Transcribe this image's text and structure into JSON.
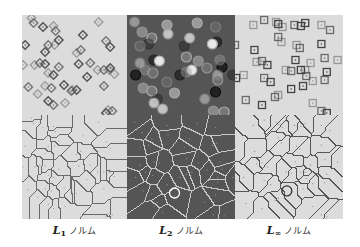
{
  "figure": {
    "panels": [
      {
        "id": "l1",
        "row": "top",
        "bg": "#dcdcdc",
        "marker": "diamond",
        "stroke": "#555555",
        "x": 22,
        "y": 15,
        "w": 105,
        "h": 100,
        "points": [
          [
            9,
            3
          ],
          [
            11,
            8
          ],
          [
            20,
            12
          ],
          [
            30,
            11
          ],
          [
            32,
            16
          ],
          [
            35,
            25
          ],
          [
            31,
            30
          ],
          [
            25,
            30
          ],
          [
            22,
            37
          ],
          [
            12,
            50
          ],
          [
            17,
            48
          ],
          [
            22,
            49
          ],
          [
            25,
            58
          ],
          [
            35,
            52
          ],
          [
            30,
            60
          ],
          [
            22,
            71
          ],
          [
            28,
            73
          ],
          [
            40,
            70
          ],
          [
            48,
            75
          ],
          [
            47,
            76
          ],
          [
            62,
            62
          ],
          [
            72,
            55
          ],
          [
            78,
            55
          ],
          [
            84,
            53
          ],
          [
            88,
            59
          ],
          [
            65,
            48
          ],
          [
            54,
            49
          ],
          [
            52,
            38
          ],
          [
            56,
            35
          ],
          [
            58,
            20
          ],
          [
            73,
            7
          ],
          [
            80,
            26
          ],
          [
            84,
            32
          ],
          [
            83,
            55
          ],
          [
            78,
            71
          ],
          [
            52,
            75
          ],
          [
            41,
            88
          ],
          [
            30,
            90
          ],
          [
            25,
            86
          ],
          [
            82,
            95
          ],
          [
            86,
            96
          ],
          [
            80,
            98
          ],
          [
            15,
            79
          ],
          [
            6,
            72
          ],
          [
            3,
            30
          ],
          [
            1,
            50
          ]
        ]
      },
      {
        "id": "l2",
        "row": "top",
        "bg": "#555555",
        "marker": "circle",
        "stroke": "#bbbbbb",
        "x": 127,
        "y": 15,
        "w": 108,
        "h": 100,
        "points": [
          [
            7,
            7
          ],
          [
            14,
            17
          ],
          [
            23,
            23
          ],
          [
            20,
            29
          ],
          [
            38,
            19
          ],
          [
            37,
            10
          ],
          [
            12,
            31
          ],
          [
            25,
            45
          ],
          [
            30,
            46
          ],
          [
            17,
            55
          ],
          [
            24,
            58
          ],
          [
            8,
            60
          ],
          [
            12,
            48
          ],
          [
            15,
            73
          ],
          [
            23,
            76
          ],
          [
            28,
            84
          ],
          [
            25,
            88
          ],
          [
            44,
            78
          ],
          [
            37,
            67
          ],
          [
            49,
            60
          ],
          [
            60,
            55
          ],
          [
            55,
            57
          ],
          [
            74,
            53
          ],
          [
            88,
            52
          ],
          [
            84,
            60
          ],
          [
            66,
            46
          ],
          [
            55,
            42
          ],
          [
            53,
            31
          ],
          [
            58,
            23
          ],
          [
            65,
            8
          ],
          [
            82,
            12
          ],
          [
            83,
            27
          ],
          [
            79,
            29
          ],
          [
            86,
            45
          ],
          [
            84,
            65
          ],
          [
            82,
            77
          ],
          [
            72,
            84
          ],
          [
            80,
            96
          ],
          [
            90,
            97
          ],
          [
            98,
            60
          ],
          [
            33,
            94
          ]
        ]
      },
      {
        "id": "linf",
        "row": "top",
        "bg": "#dcdcdc",
        "marker": "square",
        "stroke": "#444444",
        "x": 235,
        "y": 15,
        "w": 108,
        "h": 100,
        "points": [
          [
            17,
            10
          ],
          [
            27,
            5
          ],
          [
            40,
            9
          ],
          [
            44,
            12
          ],
          [
            55,
            10
          ],
          [
            61,
            11
          ],
          [
            43,
            27
          ],
          [
            40,
            22
          ],
          [
            18,
            35
          ],
          [
            20,
            47
          ],
          [
            25,
            46
          ],
          [
            30,
            50
          ],
          [
            8,
            60
          ],
          [
            27,
            63
          ],
          [
            33,
            67
          ],
          [
            47,
            55
          ],
          [
            52,
            56
          ],
          [
            61,
            55
          ],
          [
            65,
            55
          ],
          [
            66,
            61
          ],
          [
            63,
            71
          ],
          [
            72,
            66
          ],
          [
            83,
            65
          ],
          [
            85,
            57
          ],
          [
            70,
            48
          ],
          [
            83,
            43
          ],
          [
            56,
            45
          ],
          [
            57,
            30
          ],
          [
            60,
            33
          ],
          [
            80,
            29
          ],
          [
            80,
            10
          ],
          [
            88,
            15
          ],
          [
            65,
            8
          ],
          [
            38,
            7
          ],
          [
            10,
            85
          ],
          [
            25,
            90
          ],
          [
            40,
            80
          ],
          [
            37,
            82
          ],
          [
            52,
            74
          ],
          [
            72,
            88
          ],
          [
            80,
            96
          ],
          [
            85,
            98
          ],
          [
            95,
            45
          ],
          [
            0,
            30
          ],
          [
            1,
            63
          ]
        ]
      },
      {
        "id": "l1-voronoi",
        "row": "bottom",
        "bg": "#dcdcdc",
        "marker": "voronoi",
        "stroke": "#6a6a6a",
        "x": 22,
        "y": 115,
        "w": 105,
        "h": 104,
        "highlight": null
      },
      {
        "id": "l2-voronoi",
        "row": "bottom",
        "bg": "#555555",
        "marker": "voronoi",
        "stroke": "#c8c8c8",
        "x": 127,
        "y": 115,
        "w": 108,
        "h": 104,
        "highlight": [
          44,
          75,
          5
        ]
      },
      {
        "id": "linf-voronoi",
        "row": "bottom",
        "bg": "#dcdcdc",
        "marker": "voronoi",
        "stroke": "#555555",
        "x": 235,
        "y": 115,
        "w": 108,
        "h": 104,
        "highlight": [
          48,
          73,
          5
        ]
      }
    ],
    "captions": [
      {
        "symbol": "L",
        "sub": "1",
        "word": "ノルム",
        "x": 22,
        "w": 105
      },
      {
        "symbol": "L",
        "sub": "2",
        "word": "ノルム",
        "x": 127,
        "w": 108
      },
      {
        "symbol": "L",
        "sub": "∞",
        "word": "ノルム",
        "x": 235,
        "w": 108
      }
    ]
  }
}
